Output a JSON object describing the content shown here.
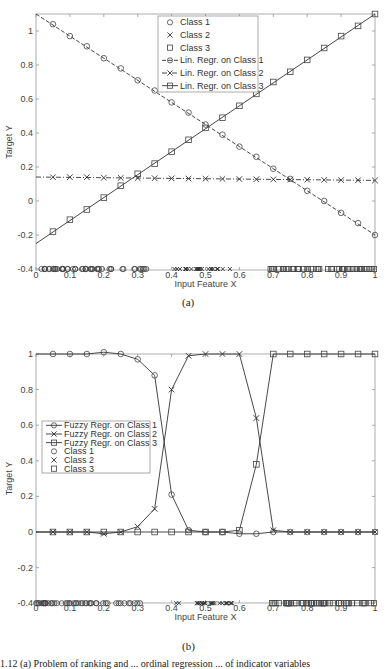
{
  "chart_data": [
    {
      "id": "a",
      "panel_label": "(a)",
      "type": "line",
      "title": "",
      "xlabel": "Input Feature X",
      "ylabel": "Target Y",
      "xlim": [
        0,
        1
      ],
      "ylim": [
        -0.4,
        1.1
      ],
      "xticks": [
        "0",
        "0.1",
        "0.2",
        "0.3",
        "0.4",
        "0.5",
        "0.6",
        "0.7",
        "0.8",
        "0.9",
        "1"
      ],
      "yticks": [
        "-0.4",
        "-0.2",
        "0",
        "0.2",
        "0.4",
        "0.6",
        "0.8",
        "1"
      ],
      "grid": false,
      "legend_position": "upper center",
      "legend": [
        "Class 1",
        "Class 2",
        "Class 3",
        "Lin. Regr. on Class 1",
        "Lin. Regr. on Class 2",
        "Lin. Regr. on Class 3"
      ],
      "x": [
        0.05,
        0.1,
        0.15,
        0.2,
        0.25,
        0.3,
        0.35,
        0.4,
        0.45,
        0.5,
        0.55,
        0.6,
        0.65,
        0.7,
        0.75,
        0.8,
        0.85,
        0.9,
        0.95,
        1.0
      ],
      "series": [
        {
          "name": "Lin. Regr. on Class 1",
          "marker": "circle",
          "dash": "dashed",
          "line_start": [
            0,
            1.1
          ],
          "line_end": [
            1,
            -0.2
          ],
          "values": [
            1.04,
            0.97,
            0.91,
            0.84,
            0.78,
            0.71,
            0.65,
            0.58,
            0.52,
            0.45,
            0.39,
            0.32,
            0.26,
            0.19,
            0.13,
            0.06,
            0.0,
            -0.07,
            -0.13,
            -0.2
          ]
        },
        {
          "name": "Lin. Regr. on Class 2",
          "marker": "x",
          "dash": "dashdot",
          "line_start": [
            0,
            0.141
          ],
          "line_end": [
            1,
            0.121
          ],
          "values": [
            0.14,
            0.14,
            0.14,
            0.137,
            0.136,
            0.135,
            0.134,
            0.133,
            0.132,
            0.131,
            0.13,
            0.129,
            0.128,
            0.127,
            0.126,
            0.125,
            0.124,
            0.123,
            0.122,
            0.121
          ]
        },
        {
          "name": "Lin. Regr. on Class 3",
          "marker": "square",
          "dash": "solid",
          "line_start": [
            0,
            -0.25
          ],
          "line_end": [
            1,
            1.1
          ],
          "values": [
            -0.18,
            -0.11,
            -0.05,
            0.02,
            0.09,
            0.16,
            0.22,
            0.29,
            0.36,
            0.43,
            0.49,
            0.56,
            0.63,
            0.7,
            0.76,
            0.83,
            0.9,
            0.97,
            1.03,
            1.1
          ]
        }
      ],
      "samples": [
        {
          "name": "Class 1",
          "marker": "circle",
          "y": -0.4,
          "x_range": [
            0.0,
            0.33
          ]
        },
        {
          "name": "Class 2",
          "marker": "x",
          "y": -0.4,
          "x_range": [
            0.4,
            0.58
          ]
        },
        {
          "name": "Class 3",
          "marker": "square",
          "y": -0.4,
          "x_range": [
            0.69,
            1.0
          ]
        }
      ]
    },
    {
      "id": "b",
      "panel_label": "(b)",
      "type": "line",
      "title": "",
      "xlabel": "Input Feature X",
      "ylabel": "Target Y",
      "xlim": [
        0,
        1
      ],
      "ylim": [
        -0.4,
        1
      ],
      "xticks": [
        "0",
        "0.1",
        "0.2",
        "0.3",
        "0.4",
        "0.5",
        "0.6",
        "0.7",
        "0.8",
        "0.9",
        "1"
      ],
      "yticks": [
        "-0.4",
        "-0.2",
        "0",
        "0.2",
        "0.4",
        "0.6",
        "0.8",
        "1"
      ],
      "grid": false,
      "legend_position": "center left",
      "legend": [
        "Fuzzy Regr. on Class 1",
        "Fuzzy Regr. on Class 2",
        "Fuzzy Regr. on Class 3",
        "Class 1",
        "Class 2",
        "Class 3"
      ],
      "x": [
        0.05,
        0.1,
        0.15,
        0.2,
        0.25,
        0.3,
        0.35,
        0.4,
        0.45,
        0.5,
        0.55,
        0.6,
        0.65,
        0.7,
        0.75,
        0.8,
        0.85,
        0.9,
        0.95,
        1.0
      ],
      "series": [
        {
          "name": "Fuzzy Regr. on Class 1",
          "marker": "circle",
          "values": [
            1.0,
            1.0,
            1.0,
            1.01,
            1.0,
            0.97,
            0.88,
            0.21,
            0.01,
            0.0,
            0.0,
            -0.01,
            -0.01,
            0.0,
            0.0,
            0.0,
            0.0,
            0.0,
            0.0,
            0.0
          ]
        },
        {
          "name": "Fuzzy Regr. on Class 2",
          "marker": "x",
          "values": [
            0.0,
            0.0,
            0.0,
            -0.01,
            0.0,
            0.03,
            0.13,
            0.8,
            0.99,
            1.0,
            1.0,
            1.0,
            0.64,
            0.01,
            0.0,
            0.0,
            0.0,
            0.0,
            0.0,
            0.0
          ]
        },
        {
          "name": "Fuzzy Regr. on Class 3",
          "marker": "square",
          "values": [
            0.0,
            0.0,
            0.0,
            0.0,
            0.0,
            0.0,
            0.0,
            0.0,
            0.0,
            0.0,
            0.0,
            0.01,
            0.38,
            1.0,
            1.0,
            1.0,
            1.0,
            1.0,
            1.0,
            1.0
          ]
        }
      ],
      "samples": [
        {
          "name": "Class 1",
          "marker": "circle",
          "y": -0.4,
          "x_range": [
            0.0,
            0.33
          ]
        },
        {
          "name": "Class 2",
          "marker": "x",
          "y": -0.4,
          "x_range": [
            0.4,
            0.58
          ]
        },
        {
          "name": "Class 3",
          "marker": "square",
          "y": -0.4,
          "x_range": [
            0.69,
            1.0
          ]
        }
      ]
    }
  ],
  "caption": "1.12 (a) Problem of ranking and ... ordinal regression ... of indicator variables"
}
